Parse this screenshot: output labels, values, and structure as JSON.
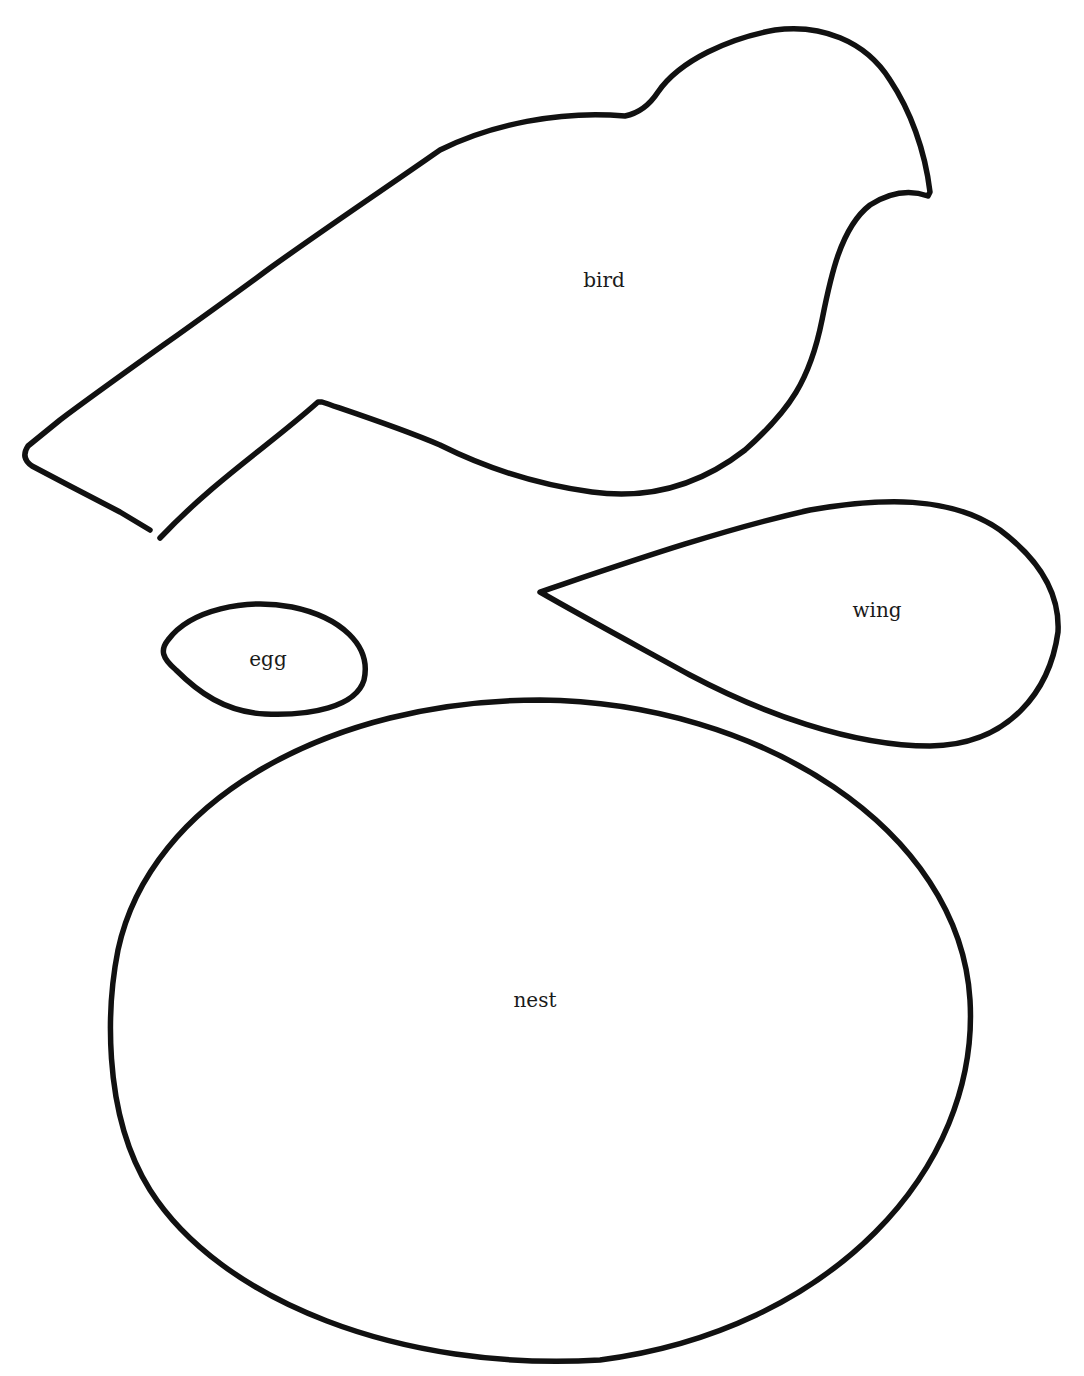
{
  "template": {
    "stroke_color": "#111111",
    "background": "#ffffff",
    "pieces": [
      {
        "id": "bird",
        "label": "bird"
      },
      {
        "id": "wing",
        "label": "wing"
      },
      {
        "id": "egg",
        "label": "egg"
      },
      {
        "id": "nest",
        "label": "nest"
      }
    ]
  }
}
